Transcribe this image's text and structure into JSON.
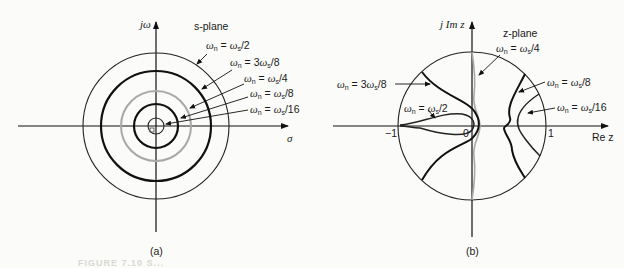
{
  "panel_a": {
    "caption": "(a)",
    "plane_label": "s-plane",
    "y_axis_label": "jω",
    "x_axis_label": "σ",
    "circles": [
      {
        "label": "ωn = ωs/2",
        "stroke": "#222222",
        "width": 1.1
      },
      {
        "label": "ωn = 3ωs/8",
        "stroke": "#111111",
        "width": 2.2
      },
      {
        "label": "ωn = ωs/4",
        "stroke": "#a8a8a8",
        "width": 2.0
      },
      {
        "label": "ωn = ωs/8",
        "stroke": "#111111",
        "width": 2.2
      },
      {
        "label": "ωn = ωs/16",
        "stroke": "#222222",
        "width": 1.1
      }
    ],
    "labels": {
      "l1": "ω",
      "l1_sub": "n",
      "l1_rest": " = ω",
      "l1_sub2": "s",
      "l1_end": "/2",
      "l2_end": "/8",
      "l2_pre": " = 3ω",
      "l3_end": "/4",
      "l4_end": "/8",
      "l5_end": "/16"
    },
    "center_marker": "0"
  },
  "panel_b": {
    "caption": "(b)",
    "plane_label": "z-plane",
    "y_axis_label": "j Im z",
    "x_axis_label": "Re z",
    "tick_neg1": "−1",
    "tick_0": "0",
    "tick_1": "1",
    "curves": [
      {
        "label": "ωn = 3ωs/8",
        "stroke": "#111111"
      },
      {
        "label": "ωn = ωs/2",
        "stroke": "#222222"
      },
      {
        "label": "ωn = ωs/4",
        "stroke": "#a8a8a8"
      },
      {
        "label": "ωn = ωs/8",
        "stroke": "#111111"
      },
      {
        "label": "ωn = ωs/16",
        "stroke": "#222222"
      }
    ]
  },
  "figure_caption": "FIGURE 7.10  S..."
}
